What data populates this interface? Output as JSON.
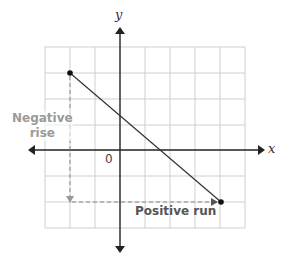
{
  "diagram": {
    "type": "coordinate-plane-slope",
    "axes": {
      "x_label": "x",
      "y_label": "y",
      "origin_label": "0"
    },
    "grid": {
      "cols": 8,
      "rows": 7,
      "x_min": -3,
      "x_max": 5,
      "y_min": -3,
      "y_max": 4
    },
    "points": [
      {
        "x": -2,
        "y": 3
      },
      {
        "x": 4,
        "y": -2
      }
    ],
    "labels": {
      "negative_rise_line1": "Negative",
      "negative_rise_line2": "rise",
      "positive_run": "Positive run"
    },
    "colors": {
      "grid": "#cccccc",
      "axis": "#222222",
      "line": "#333333",
      "dash": "#888888",
      "rise_label": "#9a9a9a",
      "run_label": "#555555"
    }
  }
}
